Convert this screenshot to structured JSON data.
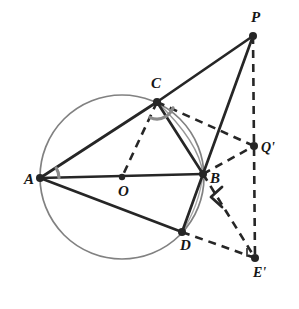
{
  "figure": {
    "background_color": "#ffffff",
    "stroke_color": "#262626",
    "circle_color": "#6b6b6b",
    "arc_mark_color": "#8a8a8a",
    "width": 299,
    "height": 309
  },
  "circle": {
    "name": "circumcircle",
    "center_label": "O",
    "cx": 122,
    "cy": 177,
    "r": 82
  },
  "points": [
    {
      "id": "A",
      "label": "A",
      "x": 40,
      "y": 178,
      "label_x": 24,
      "label_y": 184,
      "on_circle": true,
      "dot": true
    },
    {
      "id": "C",
      "label": "C",
      "x": 157,
      "y": 102,
      "label_x": 151,
      "label_y": 88,
      "on_circle": true,
      "dot": true
    },
    {
      "id": "B",
      "label": "B",
      "x": 203,
      "y": 174,
      "label_x": 210,
      "label_y": 183,
      "on_circle": true,
      "dot": true
    },
    {
      "id": "D",
      "label": "D",
      "x": 182,
      "y": 232,
      "label_x": 180,
      "label_y": 250,
      "on_circle": true,
      "dot": true
    },
    {
      "id": "O",
      "label": "O",
      "x": 122,
      "y": 177,
      "label_x": 118,
      "label_y": 196,
      "on_circle": false,
      "dot": true
    },
    {
      "id": "P",
      "label": "P",
      "x": 253,
      "y": 36,
      "label_x": 251,
      "label_y": 22,
      "on_circle": false,
      "dot": true
    },
    {
      "id": "Q'",
      "label": "Q'",
      "x": 254,
      "y": 146,
      "label_x": 261,
      "label_y": 152,
      "on_circle": false,
      "dot": true
    },
    {
      "id": "E'",
      "label": "E'",
      "x": 255,
      "y": 258,
      "label_x": 253,
      "label_y": 277,
      "on_circle": false,
      "dot": true
    }
  ],
  "solid_segments": [
    {
      "name": "segment-A-C",
      "from": "A",
      "to": "C",
      "x1": 40,
      "y1": 178,
      "x2": 157,
      "y2": 102
    },
    {
      "name": "segment-A-B",
      "from": "A",
      "to": "B",
      "x1": 40,
      "y1": 178,
      "x2": 203,
      "y2": 174
    },
    {
      "name": "segment-A-D",
      "from": "A",
      "to": "D",
      "x1": 40,
      "y1": 178,
      "x2": 182,
      "y2": 232
    },
    {
      "name": "segment-C-B",
      "from": "C",
      "to": "B",
      "x1": 157,
      "y1": 102,
      "x2": 203,
      "y2": 174
    },
    {
      "name": "segment-C-P",
      "from": "C",
      "to": "P",
      "x1": 157,
      "y1": 102,
      "x2": 253,
      "y2": 36
    },
    {
      "name": "segment-B-P",
      "from": "B",
      "to": "P",
      "x1": 203,
      "y1": 174,
      "x2": 253,
      "y2": 36
    },
    {
      "name": "segment-B-D",
      "from": "B",
      "to": "D",
      "x1": 203,
      "y1": 174,
      "x2": 182,
      "y2": 232
    }
  ],
  "dashed_segments": [
    {
      "name": "segment-C-O-dashed",
      "from": "C",
      "to": "O",
      "x1": 157,
      "y1": 102,
      "x2": 122,
      "y2": 177
    },
    {
      "name": "segment-C-Qprime-dashed",
      "from": "C",
      "to": "Q'",
      "x1": 157,
      "y1": 102,
      "x2": 254,
      "y2": 146
    },
    {
      "name": "segment-B-Qprime-dashed",
      "from": "B",
      "to": "Q'",
      "x1": 203,
      "y1": 174,
      "x2": 254,
      "y2": 146
    },
    {
      "name": "segment-B-Eprime-dashed",
      "from": "B",
      "to": "E'",
      "x1": 203,
      "y1": 174,
      "x2": 255,
      "y2": 258
    },
    {
      "name": "segment-D-Eprime-dashed",
      "from": "D",
      "to": "E'",
      "x1": 182,
      "y1": 232,
      "x2": 255,
      "y2": 258
    },
    {
      "name": "segment-P-Eprime-dashed",
      "from": "P",
      "to": "E'",
      "x1": 253,
      "y1": 36,
      "x2": 255,
      "y2": 258
    }
  ],
  "angle_marks": [
    {
      "name": "angle-mark-at-A",
      "vertex": "A",
      "cx": 40,
      "cy": 178,
      "r": 19,
      "start_deg": 328,
      "end_deg": 359,
      "double": false
    },
    {
      "name": "angle-mark-at-C-left",
      "vertex": "C",
      "cx": 157,
      "cy": 102,
      "r": 17,
      "start_deg": 60,
      "end_deg": 115,
      "double": false
    },
    {
      "name": "angle-mark-at-C-right",
      "vertex": "C",
      "cx": 157,
      "cy": 102,
      "r": 17,
      "start_deg": 20,
      "end_deg": 58,
      "double": false
    },
    {
      "name": "angle-mark-at-B",
      "vertex": "B",
      "cx": 216,
      "cy": 196,
      "r": 0,
      "start_deg": 0,
      "end_deg": 0,
      "double": false
    }
  ],
  "right_angle_mark": {
    "name": "right-angle-mark-at-Eprime",
    "vertex": "E'",
    "x": 255,
    "y": 258,
    "size": 8
  },
  "chord_arc_CB": {
    "name": "arc-chord-C-to-B",
    "note": "faint curved arc bulging right between C and B"
  }
}
